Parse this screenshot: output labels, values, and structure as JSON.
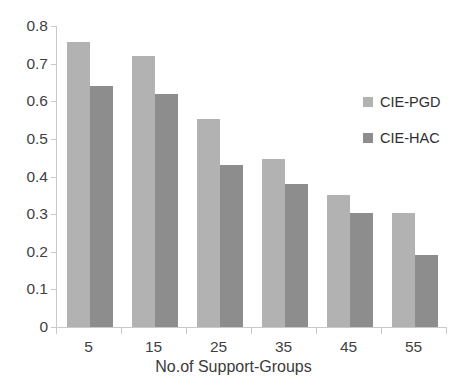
{
  "chart_data": {
    "type": "bar",
    "title": "",
    "xlabel": "No.of Support-Groups",
    "ylabel": "",
    "categories": [
      "5",
      "15",
      "25",
      "35",
      "45",
      "55"
    ],
    "series": [
      {
        "name": "CIE-PGD",
        "color": "#b2b2b2",
        "values": [
          0.757,
          0.72,
          0.553,
          0.447,
          0.35,
          0.303
        ]
      },
      {
        "name": "CIE-HAC",
        "color": "#8d8d8d",
        "values": [
          0.64,
          0.62,
          0.43,
          0.38,
          0.303,
          0.192
        ]
      }
    ],
    "ylim": [
      0,
      0.8
    ],
    "yticks": [
      "0",
      "0.1",
      "0.2",
      "0.3",
      "0.4",
      "0.5",
      "0.6",
      "0.7",
      "0.8"
    ],
    "ytick_values": [
      0,
      0.1,
      0.2,
      0.3,
      0.4,
      0.5,
      0.6,
      0.7,
      0.8
    ],
    "grid": false,
    "legend_position": "right"
  },
  "legend": {
    "items": [
      {
        "label": "CIE-PGD"
      },
      {
        "label": "CIE-HAC"
      }
    ]
  },
  "axis": {
    "x_title": "No.of Support-Groups"
  }
}
